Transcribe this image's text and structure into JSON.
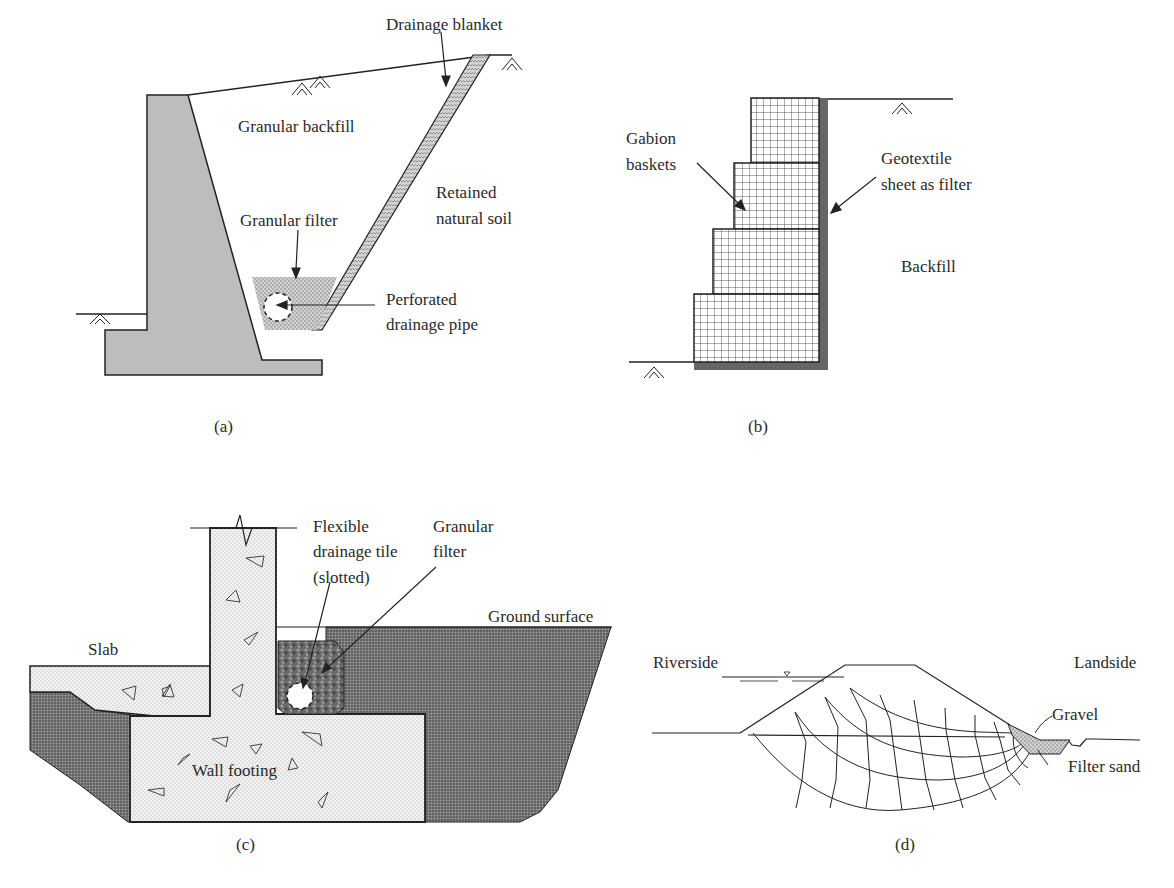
{
  "panels": {
    "a": {
      "caption": "(a)",
      "labels": {
        "drainage_blanket": "Drainage blanket",
        "granular_backfill": "Granular backfill",
        "retained_line1": "Retained",
        "retained_line2": "natural soil",
        "granular_filter": "Granular filter",
        "perforated_line1": "Perforated",
        "perforated_line2": "drainage pipe"
      }
    },
    "b": {
      "caption": "(b)",
      "labels": {
        "gabion_line1": "Gabion",
        "gabion_line2": "baskets",
        "geotextile_line1": "Geotextile",
        "geotextile_line2": "sheet as filter",
        "backfill": "Backfill"
      }
    },
    "c": {
      "caption": "(c)",
      "labels": {
        "flexible_line1": "Flexible",
        "flexible_line2": "drainage tile",
        "flexible_line3": "(slotted)",
        "granular_line1": "Granular",
        "granular_line2": "filter",
        "ground_surface": "Ground surface",
        "slab": "Slab",
        "wall_footing": "Wall footing"
      }
    },
    "d": {
      "caption": "(d)",
      "labels": {
        "riverside": "Riverside",
        "landside": "Landside",
        "gravel": "Gravel",
        "filter_sand": "Filter sand"
      }
    }
  }
}
